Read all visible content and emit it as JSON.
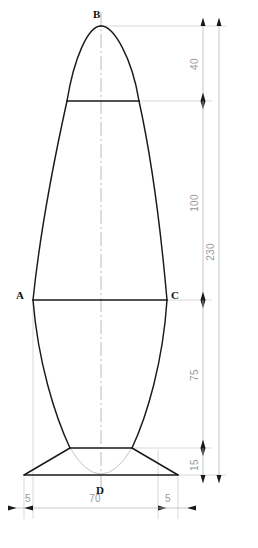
{
  "drawing": {
    "title": "Vertical axisymmetric profile — dimensioned outline",
    "units": "mm",
    "colors": {
      "outline": "#1a1a1a",
      "dimension": "#b3b3b3",
      "dimension_text": "#9a9a9a",
      "centerline": "#aaaaaa",
      "hidden_curve": "#bdbdbd",
      "background": "#ffffff",
      "point_label": "#111111"
    },
    "points": [
      {
        "name": "B",
        "label": "B",
        "role": "apex-top",
        "x": 101,
        "y": 26,
        "label_x": 93,
        "label_y": 18
      },
      {
        "name": "A",
        "label": "A",
        "role": "left-max-width",
        "x": 33,
        "y": 300,
        "label_x": 18,
        "label_y": 298
      },
      {
        "name": "C",
        "label": "C",
        "role": "right-max-width",
        "x": 167,
        "y": 300,
        "label_x": 172,
        "label_y": 298
      },
      {
        "name": "D",
        "label": "D",
        "role": "base-center",
        "x": 101,
        "y": 475,
        "label_x": 96,
        "label_y": 492
      }
    ],
    "vertical_dimensions": [
      {
        "name": "dim-40",
        "value": "40",
        "from_y": 26,
        "to_y": 101,
        "line_x": 203,
        "label_x": 198,
        "label_y": 64
      },
      {
        "name": "dim-100",
        "value": "100",
        "from_y": 101,
        "to_y": 300,
        "line_x": 203,
        "label_x": 198,
        "label_y": 203
      },
      {
        "name": "dim-75",
        "value": "75",
        "from_y": 300,
        "to_y": 448,
        "line_x": 203,
        "label_x": 198,
        "label_y": 375
      },
      {
        "name": "dim-15",
        "value": "15",
        "from_y": 448,
        "to_y": 475,
        "line_x": 203,
        "label_x": 198,
        "label_y": 465
      },
      {
        "name": "dim-230",
        "value": "230",
        "from_y": 26,
        "to_y": 475,
        "line_x": 219,
        "label_x": 214,
        "label_y": 252
      }
    ],
    "horizontal_dimensions": [
      {
        "name": "dim-left-5",
        "value": "5",
        "from_x": 24,
        "to_x": 33,
        "line_y": 508,
        "label_x": 28,
        "label_y": 500
      },
      {
        "name": "dim-70",
        "value": "70",
        "from_x": 33,
        "to_x": 158,
        "line_y": 508,
        "label_x": 95,
        "label_y": 500
      },
      {
        "name": "dim-right-5",
        "value": "5",
        "from_x": 158,
        "to_x": 178,
        "line_y": 508,
        "label_x": 168,
        "label_y": 500
      }
    ],
    "features": {
      "centerline": {
        "name": "vertical-centerline",
        "x": 101,
        "top": 12,
        "bottom": 492
      },
      "shoulder_line": {
        "name": "shoulder-chord",
        "y": 101,
        "x1": 67,
        "x2": 139
      },
      "waist_line": {
        "name": "waist-chord",
        "y": 448,
        "x1": 70,
        "x2": 132
      },
      "max_width_line": {
        "name": "max-width-chord",
        "y": 300,
        "x1": 33,
        "x2": 167
      },
      "base_line": {
        "name": "base-chord",
        "y": 475,
        "x1": 24,
        "x2": 178
      }
    }
  }
}
